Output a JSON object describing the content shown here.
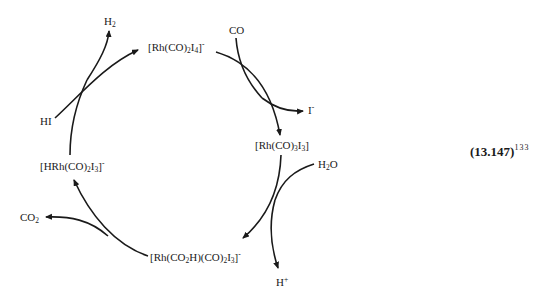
{
  "diagram": {
    "type": "catalytic-cycle",
    "equation_number": "(13.147)",
    "reference": "133",
    "species": [
      {
        "id": "rh_co2_i4",
        "formula": "[Rh(CO)2I4]-",
        "parts": [
          "[Rh(CO)",
          "2",
          "I",
          "4",
          "]",
          "-"
        ]
      },
      {
        "id": "rh_co3_i3",
        "formula": "[Rh(CO)3I3]",
        "parts": [
          "[Rh(CO)",
          "3",
          "I",
          "3",
          "]"
        ]
      },
      {
        "id": "rh_co2h",
        "formula": "[Rh(CO2H)(CO)2I3]-",
        "parts": [
          "[Rh(CO",
          "2",
          "H)(CO)",
          "2",
          "I",
          "3",
          "]",
          "-"
        ]
      },
      {
        "id": "hrh_co2_i3",
        "formula": "[HRh(CO)2I3]-",
        "parts": [
          "[HRh(CO)",
          "2",
          "I",
          "3",
          "]",
          "-"
        ]
      }
    ],
    "reagents": {
      "co": "CO",
      "i_minus": {
        "base": "I",
        "charge": "-"
      },
      "h2o": {
        "a": "H",
        "sub": "2",
        "b": "O"
      },
      "h_plus": {
        "base": "H",
        "charge": "+"
      },
      "co2": {
        "base": "CO",
        "sub": "2"
      },
      "hi": "HI",
      "h2": {
        "base": "H",
        "sub": "2"
      }
    },
    "steps": [
      {
        "from": "[Rh(CO)2I4]-",
        "to": "[Rh(CO)3I3]",
        "in": "CO",
        "out": "I-"
      },
      {
        "from": "[Rh(CO)3I3]",
        "to": "[Rh(CO2H)(CO)2I3]-",
        "in": "H2O",
        "out": "H+"
      },
      {
        "from": "[Rh(CO2H)(CO)2I3]-",
        "to": "[HRh(CO)2I3]-",
        "in": "",
        "out": "CO2"
      },
      {
        "from": "[HRh(CO)2I3]-",
        "to": "[Rh(CO)2I4]-",
        "in": "HI",
        "out": "H2"
      }
    ]
  }
}
